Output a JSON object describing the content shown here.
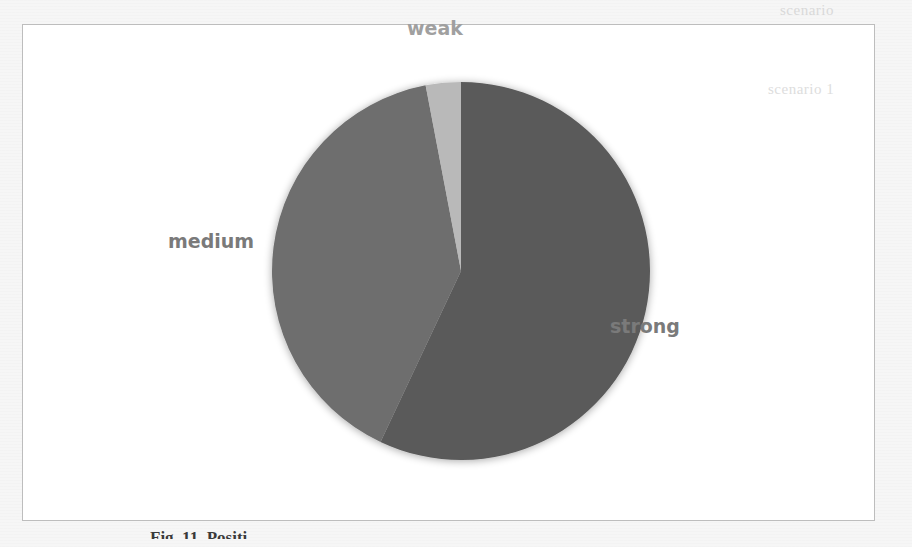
{
  "chart_data": {
    "type": "pie",
    "title": "",
    "categories": [
      "strong",
      "medium",
      "weak"
    ],
    "values": [
      57,
      40,
      3
    ],
    "unit": "percent (estimated from slice angles)",
    "colors": [
      "#5a5a5a",
      "#6e6e6e",
      "#b9b9b9"
    ],
    "start_angle_deg": 0,
    "direction": "clockwise from 12 o'clock: strong, medium, weak",
    "legend": "none (labels placed outside slices)",
    "labels": {
      "strong": "strong",
      "medium": "medium",
      "weak": "weak"
    }
  },
  "chart": {
    "label_color": "#7a7a7a",
    "frame_border": "#bdbdbd",
    "background": "#ffffff"
  },
  "caption": {
    "text": "Fig. 11.  Positi..."
  },
  "background_bleed": {
    "top_right": "scenario",
    "right_upper": "scenario 1"
  }
}
